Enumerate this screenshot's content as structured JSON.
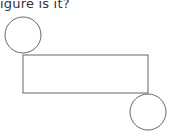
{
  "question": {
    "text": "igure is it?"
  },
  "figure": {
    "stroke_color": "#666666",
    "fill_color": "#ffffff",
    "shapes": [
      {
        "type": "circle",
        "name": "top-left-circle",
        "cx": 23,
        "cy": 35,
        "r": 18
      },
      {
        "type": "rectangle",
        "name": "center-rectangle",
        "x": 23,
        "y": 55,
        "width": 125,
        "height": 38
      },
      {
        "type": "circle",
        "name": "bottom-right-circle",
        "cx": 148,
        "cy": 112,
        "r": 18
      }
    ]
  }
}
